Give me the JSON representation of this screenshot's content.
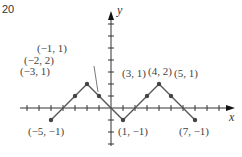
{
  "figure": {
    "number": "20"
  },
  "chart_data": {
    "type": "line",
    "title": "",
    "xlabel": "x",
    "ylabel": "y",
    "xlim": [
      -7,
      10
    ],
    "ylim": [
      -3,
      8
    ],
    "grid": false,
    "series": [
      {
        "name": "piecewise-linear",
        "points": [
          {
            "x": -5,
            "y": -1,
            "label": "(−5, −1)"
          },
          {
            "x": -3,
            "y": 1,
            "label": "(−3, 1)"
          },
          {
            "x": -2,
            "y": 2,
            "label": "(−2, 2)"
          },
          {
            "x": -1,
            "y": 1,
            "label": "(−1, 1)"
          },
          {
            "x": 1,
            "y": -1,
            "label": "(1, −1)"
          },
          {
            "x": 3,
            "y": 1,
            "label": "(3, 1)"
          },
          {
            "x": 4,
            "y": 2,
            "label": "(4, 2)"
          },
          {
            "x": 5,
            "y": 1,
            "label": "(5, 1)"
          },
          {
            "x": 7,
            "y": -1,
            "label": "(7, −1)"
          }
        ]
      }
    ],
    "colors": {
      "line": "#555555",
      "axis": "#333333",
      "point": "#444444"
    }
  }
}
